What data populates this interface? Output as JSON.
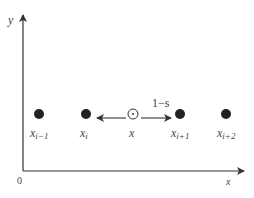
{
  "diagram": {
    "axes": {
      "y_label": "y",
      "x_label": "x",
      "origin_label": "0"
    },
    "points": [
      {
        "base": "x",
        "sub": "i−1",
        "cx": 39
      },
      {
        "base": "x",
        "sub": "i",
        "cx": 86
      },
      {
        "base": "x",
        "sub": "i+1",
        "cx": 180
      },
      {
        "base": "x",
        "sub": "i+2",
        "cx": 226
      }
    ],
    "interp_point": {
      "label": "x",
      "symbol": "circle-dot"
    },
    "arrow_label": "1−s",
    "colors": {
      "axis": "#333333",
      "point": "#222222",
      "text": "#444444"
    }
  }
}
